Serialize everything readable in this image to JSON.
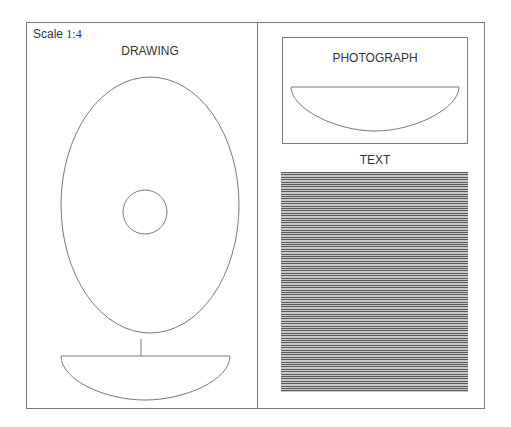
{
  "sheet": {
    "scale_prefix": "Scale ",
    "scale_value": "1:4"
  },
  "drawing": {
    "title": "DRAWING",
    "outer_ellipse": {
      "cx": 150,
      "cy": 205,
      "rx": 89,
      "ry": 128
    },
    "inner_circle": {
      "cx": 145,
      "cy": 212,
      "r": 22
    },
    "profile": {
      "left": 61,
      "right": 230,
      "top": 356,
      "bottom": 400
    }
  },
  "photograph": {
    "title": "PHOTOGRAPH",
    "profile": {
      "left": 291,
      "right": 459,
      "top": 87,
      "bottom": 131
    }
  },
  "text_panel": {
    "title": "TEXT"
  },
  "colors": {
    "line": "#7a7a7a",
    "text_lines_dark": "#5a5a5a",
    "text_lines_light": "#c8c8c8"
  }
}
